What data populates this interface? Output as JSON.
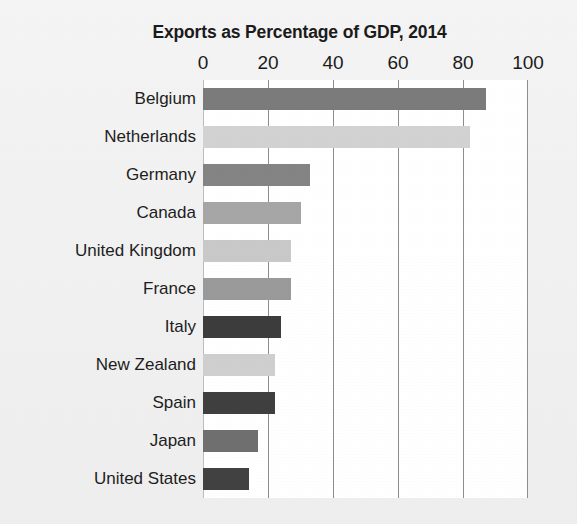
{
  "chart_data": {
    "type": "bar",
    "orientation": "horizontal",
    "title": "Exports as Percentage of GDP, 2014",
    "xlabel": "",
    "ylabel": "",
    "xlim": [
      0,
      100
    ],
    "xticks": [
      0,
      20,
      40,
      60,
      80,
      100
    ],
    "xtick_labels": [
      "0",
      "20",
      "40",
      "60",
      "80",
      "100"
    ],
    "grid": "vertical",
    "legend": "none",
    "categories": [
      "Belgium",
      "Netherlands",
      "Germany",
      "Canada",
      "United Kingdom",
      "France",
      "Italy",
      "New Zealand",
      "Spain",
      "Japan",
      "United States"
    ],
    "values": [
      87,
      82,
      33,
      30,
      27,
      27,
      24,
      22,
      22,
      17,
      14
    ],
    "bar_colors": [
      "#7b7b7b",
      "#d2d2d2",
      "#848484",
      "#a6a6a6",
      "#c9c9c9",
      "#9a9a9a",
      "#3c3c3c",
      "#cfcfcf",
      "#3f3f3f",
      "#6f6f6f",
      "#414141"
    ]
  },
  "colors": {
    "page_background": "#f1f1f1",
    "plot_background": "#ffffff",
    "gridline": "#8d8d8d",
    "text": "#1b1b1b"
  }
}
